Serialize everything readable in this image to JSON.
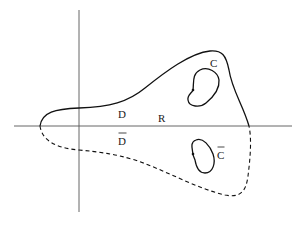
{
  "diagram": {
    "type": "complex-plane-region",
    "labels": {
      "region_upper": "D",
      "region_lower": "D",
      "real_axis": "R",
      "contour_upper": "C",
      "contour_lower": "C"
    },
    "label_decorations": {
      "region_lower": "overline",
      "contour_lower": "overline"
    },
    "line_styles": {
      "upper_boundary": "solid",
      "lower_boundary": "dashed",
      "contours": "solid",
      "axes": "solid"
    },
    "colors": {
      "background": "#ffffff",
      "ink": "#111111",
      "axis": "#555555"
    }
  }
}
